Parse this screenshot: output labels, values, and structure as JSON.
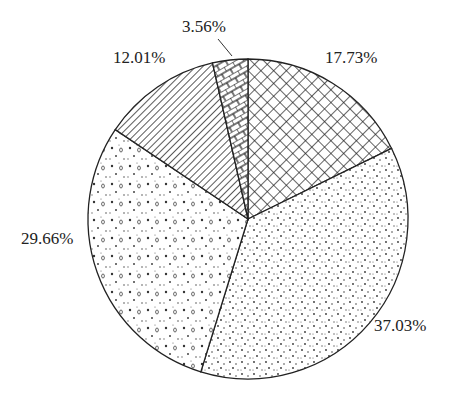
{
  "chart_data": {
    "type": "pie",
    "title": "",
    "start_angle_deg": 0,
    "direction": "clockwise",
    "slices": [
      {
        "label": "17.73%",
        "value": 17.73,
        "pattern": "crosshatch"
      },
      {
        "label": "37.03%",
        "value": 37.03,
        "pattern": "fine-dots"
      },
      {
        "label": "29.66%",
        "value": 29.66,
        "pattern": "dots-and-circles"
      },
      {
        "label": "12.01%",
        "value": 12.01,
        "pattern": "diagonal-lines"
      },
      {
        "label": "3.56%",
        "value": 3.56,
        "pattern": "brick"
      }
    ]
  },
  "labels": {
    "s0": "17.73%",
    "s1": "37.03%",
    "s2": "29.66%",
    "s3": "12.01%",
    "s4": "3.56%"
  }
}
